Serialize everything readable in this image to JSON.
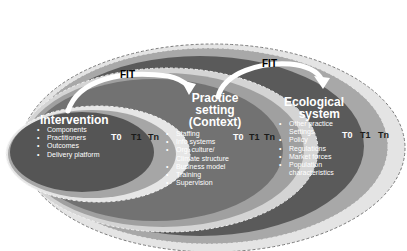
{
  "diagram": {
    "type": "nested-ellipses",
    "levels": [
      {
        "title": "Intervention",
        "items": [
          "Components",
          "Practitioners",
          "Outcomes",
          "Delivery platform"
        ],
        "time_labels": [
          "T0",
          "T1",
          "Tn"
        ]
      },
      {
        "title_lines": [
          "Practice",
          "setting",
          "(Context)"
        ],
        "items": [
          "Staffing",
          "Info systems",
          "Org. culture/",
          "Climate structure",
          "Business model",
          "Training",
          "Supervision"
        ],
        "time_labels": [
          "T0",
          "T1",
          "Tn"
        ]
      },
      {
        "title_lines": [
          "Ecological",
          "system"
        ],
        "items": [
          "Other practice",
          "Settings",
          "Policy",
          "Regulations",
          "Market forces",
          "Population",
          "characteristics"
        ],
        "time_labels": [
          "T0",
          "T1",
          "Tn"
        ]
      }
    ],
    "arrows": [
      {
        "label": "FIT",
        "from": "Intervention",
        "to": "Practice setting (Context)"
      },
      {
        "label": "FIT",
        "from": "Practice setting (Context)",
        "to": "Ecological system"
      }
    ],
    "colors": {
      "dark": "#575757",
      "mid": "#6e6e6e",
      "t1_band": "#a3a3a3",
      "tn_band": "#d9d9d9",
      "arrow": "#ffffff",
      "dashed_outline": "#7a7a7a"
    },
    "bullet": "•"
  }
}
